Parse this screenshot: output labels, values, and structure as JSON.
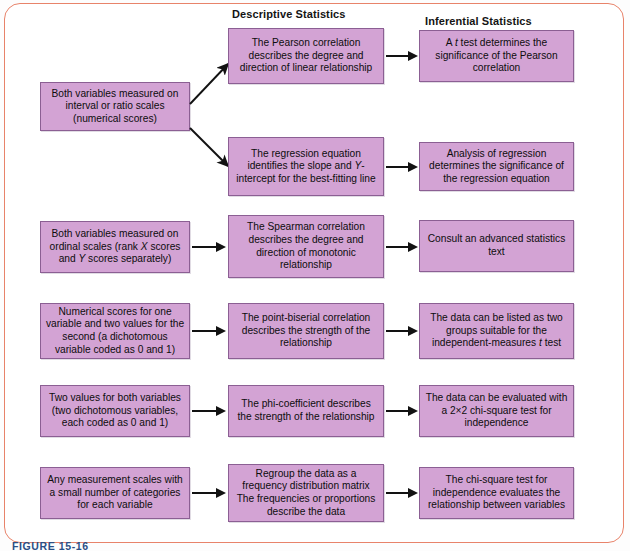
{
  "figure": {
    "caption": "FIGURE 15-16",
    "frame_color": "#e8836a",
    "node_fill": "#d3a3d4",
    "node_border": "#8b5f93",
    "arrow_color": "#121212"
  },
  "headers": {
    "descriptive": "Descriptive Statistics",
    "inferential": "Inferential Statistics"
  },
  "rows": [
    {
      "id": "interval-ratio",
      "condition": "Both variables measured on interval or ratio scales (numerical scores)",
      "descriptive": "The Pearson correlation describes the degree and direction of linear relationship",
      "inferential": "A t test determines the significance of the Pearson correlation"
    },
    {
      "id": "regression",
      "condition": "",
      "descriptive": "The regression equation identifies the slope and Y-intercept for the best-fitting line",
      "inferential": "Analysis of regression determines the significance of the regression equation"
    },
    {
      "id": "ordinal",
      "condition": "Both variables measured on ordinal scales (rank X scores and Y scores separately)",
      "descriptive": "The Spearman correlation describes the degree and direction of monotonic relationship",
      "inferential": "Consult an advanced statistics text"
    },
    {
      "id": "point-biserial",
      "condition": "Numerical scores for one variable and two values for the second (a dichotomous variable coded as 0 and 1)",
      "descriptive": "The point-biserial correlation describes the strength of the relationship",
      "inferential": "The data can be listed as two groups suitable for the independent-measures t test"
    },
    {
      "id": "phi-coefficient",
      "condition": "Two values for both variables (two dichotomous variables, each coded as 0 and 1)",
      "descriptive": "The phi-coefficient describes the strength of the relationship",
      "inferential": "The data can be evaluated with a 2×2 chi-square test for independence"
    },
    {
      "id": "chi-square",
      "condition": "Any measurement scales with a small number of categories for each variable",
      "descriptive": "Regroup the data as a frequency distribution matrix The frequencies or proportions describe the data",
      "inferential": "The chi-square test for independence evaluates the relationship between variables"
    }
  ]
}
